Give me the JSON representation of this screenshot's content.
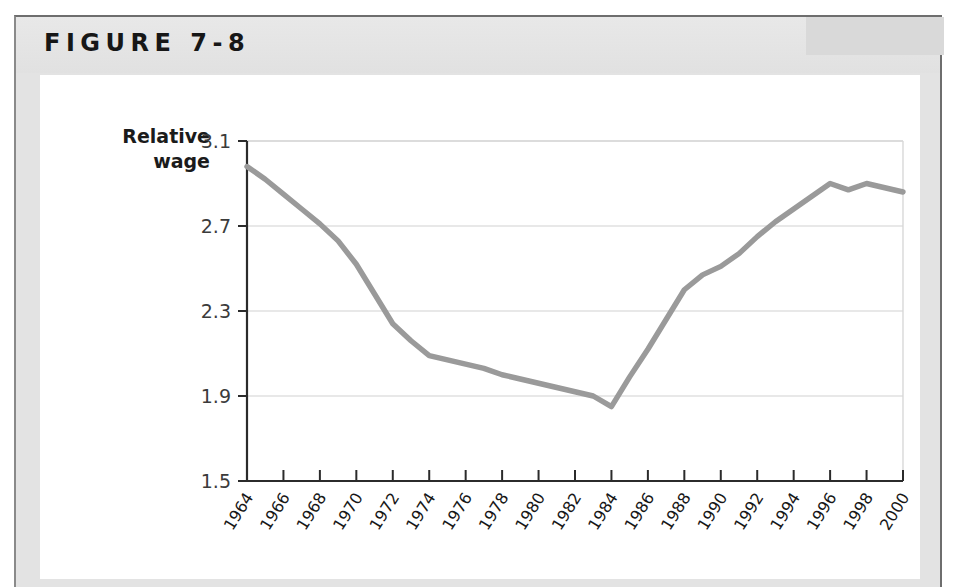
{
  "figure": {
    "label": "FIGURE 7-8",
    "card_bg": "#e3e3e3",
    "panel_bg": "#ffffff"
  },
  "chart_data": {
    "type": "line",
    "title": "FIGURE 7-8",
    "xlabel": "",
    "ylabel": "Relative wage",
    "ylabel_lines": [
      "Relative",
      "wage"
    ],
    "line_color": "#9a9a9a",
    "grid": true,
    "legend": "none",
    "xlim": [
      1964,
      2000
    ],
    "ylim": [
      1.5,
      3.1
    ],
    "ytick_labels": [
      "3.1",
      "2.7",
      "2.3",
      "1.9",
      "1.5"
    ],
    "yticks": [
      3.1,
      2.7,
      2.3,
      1.9,
      1.5
    ],
    "xtick_labels": [
      "1964",
      "1966",
      "1968",
      "1970",
      "1972",
      "1974",
      "1976",
      "1978",
      "1980",
      "1982",
      "1984",
      "1986",
      "1988",
      "1990",
      "1992",
      "1994",
      "1996",
      "1998",
      "2000"
    ],
    "xticks": [
      1964,
      1966,
      1968,
      1970,
      1972,
      1974,
      1976,
      1978,
      1980,
      1982,
      1984,
      1986,
      1988,
      1990,
      1992,
      1994,
      1996,
      1998,
      2000
    ],
    "x": [
      1964,
      1965,
      1966,
      1967,
      1968,
      1969,
      1970,
      1971,
      1972,
      1973,
      1974,
      1975,
      1976,
      1977,
      1978,
      1979,
      1980,
      1981,
      1982,
      1983,
      1984,
      1985,
      1986,
      1987,
      1988,
      1989,
      1990,
      1991,
      1992,
      1993,
      1994,
      1995,
      1996,
      1997,
      1998,
      1999,
      2000
    ],
    "values": [
      2.98,
      2.92,
      2.85,
      2.78,
      2.71,
      2.63,
      2.52,
      2.38,
      2.24,
      2.16,
      2.09,
      2.07,
      2.05,
      2.03,
      2.0,
      1.98,
      1.96,
      1.94,
      1.92,
      1.9,
      1.85,
      1.99,
      2.12,
      2.26,
      2.4,
      2.47,
      2.51,
      2.57,
      2.65,
      2.72,
      2.78,
      2.84,
      2.9,
      2.87,
      2.9,
      2.88,
      2.86
    ]
  }
}
